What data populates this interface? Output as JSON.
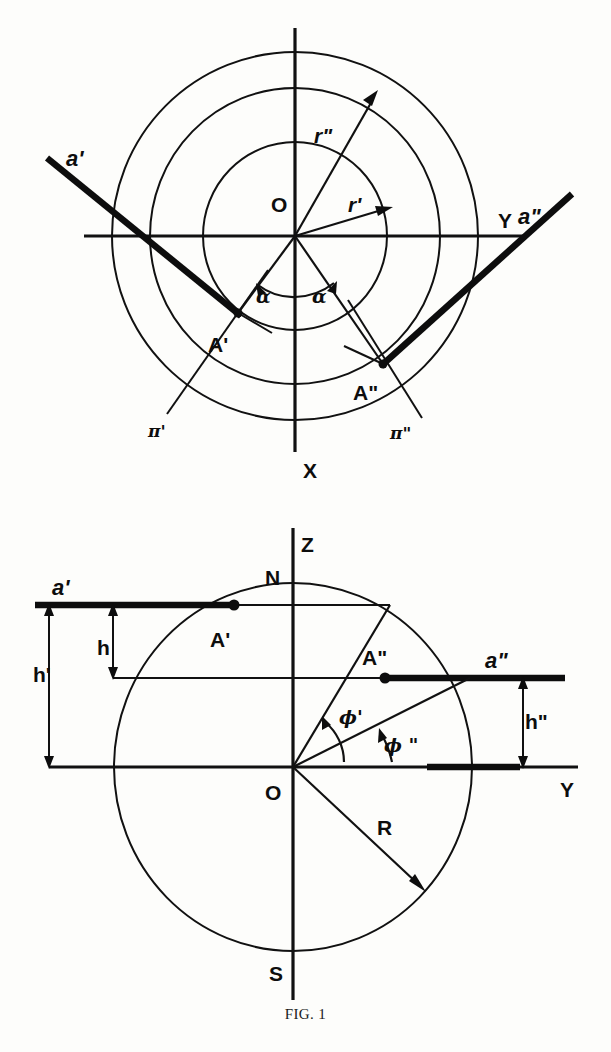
{
  "figure": {
    "caption": "FIG. 1",
    "caption_top": 1008
  },
  "top_panel": {
    "name": "polar-projection-view",
    "origin": {
      "x": 295,
      "y": 236
    },
    "circles": [
      {
        "name": "outer-circle",
        "rx": 183,
        "ry": 184
      },
      {
        "name": "middle-circle",
        "rx": 145,
        "ry": 148
      },
      {
        "name": "inner-circle",
        "rx": 92,
        "ry": 94
      }
    ],
    "axes": {
      "y_axis_label": "Y",
      "x_axis_label": "X",
      "origin_label": "O",
      "y_axis_label_pos": {
        "x": 498,
        "y": 228
      },
      "x_axis_label_pos": {
        "x": 303,
        "y": 478
      },
      "origin_label_pos": {
        "x": 271,
        "y": 212
      }
    },
    "points": [
      {
        "label": "A'",
        "x": 238,
        "y": 313,
        "label_pos": {
          "x": 212,
          "y": 348
        }
      },
      {
        "label": "A\"",
        "x": 383,
        "y": 364,
        "label_pos": {
          "x": 356,
          "y": 398
        }
      }
    ],
    "rays": [
      {
        "label": "a'",
        "label_pos": {
          "x": 68,
          "y": 163
        },
        "from": {
          "x": 47,
          "y": 158
        },
        "to": {
          "x": 238,
          "y": 313
        }
      },
      {
        "label": "a\"",
        "label_pos": {
          "x": 522,
          "y": 218
        },
        "from": {
          "x": 570,
          "y": 196
        },
        "to": {
          "x": 383,
          "y": 364
        }
      }
    ],
    "radius_vectors": [
      {
        "label": "r'",
        "label_pos": {
          "x": 352,
          "y": 208
        },
        "tip": {
          "x": 392,
          "y": 208
        }
      },
      {
        "label": "r\"",
        "label_pos": {
          "x": 318,
          "y": 139
        },
        "tip": {
          "x": 378,
          "y": 95
        }
      }
    ],
    "plane_traces": [
      {
        "label": "π'",
        "label_pos": {
          "x": 154,
          "y": 433
        }
      },
      {
        "label": "π\"",
        "label_pos": {
          "x": 396,
          "y": 435
        }
      }
    ],
    "angles": [
      {
        "label": "α",
        "label_pos": {
          "x": 261,
          "y": 297
        }
      },
      {
        "label": "α",
        "label_pos": {
          "x": 316,
          "y": 297
        }
      }
    ]
  },
  "bottom_panel": {
    "name": "meridian-section-view",
    "origin": {
      "x": 293,
      "y": 767
    },
    "circle": {
      "name": "earth-circle",
      "rx": 179,
      "ry": 184
    },
    "axes": {
      "z_axis_label": "Z",
      "y_axis_label": "Y",
      "north_label": "N",
      "south_label": "S",
      "origin_label": "O",
      "z_axis_label_pos": {
        "x": 303,
        "y": 545
      },
      "north_label_pos": {
        "x": 268,
        "y": 578
      },
      "south_label_pos": {
        "x": 272,
        "y": 973
      },
      "y_axis_label_pos": {
        "x": 565,
        "y": 789
      },
      "origin_label_pos": {
        "x": 268,
        "y": 795
      }
    },
    "points": [
      {
        "label": "A'",
        "x": 234,
        "y": 605,
        "label_pos": {
          "x": 213,
          "y": 641
        }
      },
      {
        "label": "A\"",
        "x": 385,
        "y": 678,
        "label_pos": {
          "x": 365,
          "y": 659
        }
      }
    ],
    "rays": [
      {
        "label": "a'",
        "label_pos": {
          "x": 56,
          "y": 589
        },
        "y": 605,
        "x_from": 35,
        "x_to": 234
      },
      {
        "label": "a\"",
        "label_pos": {
          "x": 489,
          "y": 662
        },
        "y": 678,
        "x_from": 385,
        "x_to": 563
      }
    ],
    "heights": [
      {
        "label": "h",
        "label_pos": {
          "x": 103,
          "y": 650
        },
        "x": 113,
        "y_top": 605,
        "y_bottom": 678
      },
      {
        "label": "h'",
        "label_pos": {
          "x": 41,
          "y": 676
        },
        "x": 49,
        "y_top": 605,
        "y_bottom": 767
      },
      {
        "label": "h\"",
        "label_pos": {
          "x": 530,
          "y": 722
        },
        "x": 523,
        "y_top": 678,
        "y_bottom": 767
      }
    ],
    "angles": [
      {
        "label": "ϕ'",
        "label_pos": {
          "x": 345,
          "y": 718
        }
      },
      {
        "label": "ϕ \"",
        "label_pos": {
          "x": 389,
          "y": 745
        }
      }
    ],
    "radius_label": {
      "label": "R",
      "label_pos": {
        "x": 382,
        "y": 828
      }
    }
  },
  "colors": {
    "ink": "#111111",
    "paper": "#fdfdfb"
  }
}
